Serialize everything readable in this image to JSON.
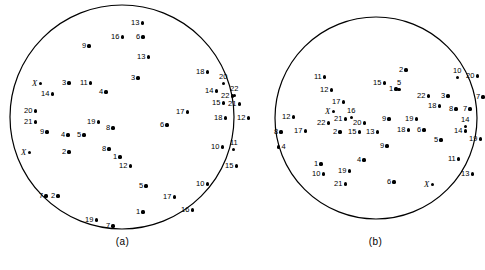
{
  "figure": {
    "type": "two-panel-circular-scatter",
    "panels": [
      {
        "id": "a",
        "caption": "(a)"
      },
      {
        "id": "b",
        "caption": "(b)"
      }
    ],
    "marker_color": "#000000",
    "outline_color": "#000000",
    "background_color": "#ffffff"
  },
  "chart_data": {
    "type": "scatter",
    "title": "",
    "xlabel": "",
    "ylabel": "",
    "grid": false,
    "legend": "none",
    "note": "Two circular fields, each containing labelled point markers. Labels are integers 1-22 plus italic X markers. Coordinates are in panel-local pixels.",
    "panels": [
      {
        "id": "a",
        "caption": "(a)",
        "circle": {
          "cx": 122,
          "cy": 117,
          "r": 112
        },
        "points": [
          {
            "label": "13",
            "x": 131,
            "y": 19,
            "side": "right"
          },
          {
            "label": "16",
            "x": 111,
            "y": 33,
            "side": "right"
          },
          {
            "label": "6",
            "x": 136,
            "y": 33,
            "side": "right"
          },
          {
            "label": "9",
            "x": 82,
            "y": 42,
            "side": "right"
          },
          {
            "label": "13",
            "x": 137,
            "y": 53,
            "side": "right"
          },
          {
            "label": "3",
            "x": 131,
            "y": 74,
            "side": "right"
          },
          {
            "label": "18",
            "x": 196,
            "y": 68,
            "side": "right"
          },
          {
            "label": "20",
            "x": 219,
            "y": 73,
            "side": "below"
          },
          {
            "label": "X",
            "x": 32,
            "y": 79,
            "side": "right"
          },
          {
            "label": "3",
            "x": 62,
            "y": 79,
            "side": "right"
          },
          {
            "label": "11",
            "x": 80,
            "y": 79,
            "side": "right"
          },
          {
            "label": "14",
            "x": 41,
            "y": 90,
            "side": "right"
          },
          {
            "label": "4",
            "x": 99,
            "y": 88,
            "side": "right"
          },
          {
            "label": "14",
            "x": 205,
            "y": 87,
            "side": "right"
          },
          {
            "label": "22",
            "x": 230,
            "y": 85,
            "side": "below"
          },
          {
            "label": "22",
            "x": 221,
            "y": 92,
            "side": "right"
          },
          {
            "label": "15",
            "x": 212,
            "y": 99,
            "side": "right"
          },
          {
            "label": "21",
            "x": 228,
            "y": 100,
            "side": "left"
          },
          {
            "label": "20",
            "x": 24,
            "y": 107,
            "side": "right"
          },
          {
            "label": "21",
            "x": 24,
            "y": 118,
            "side": "right"
          },
          {
            "label": "17",
            "x": 176,
            "y": 108,
            "side": "right"
          },
          {
            "label": "18",
            "x": 214,
            "y": 114,
            "side": "right"
          },
          {
            "label": "12",
            "x": 237,
            "y": 114,
            "side": "right"
          },
          {
            "label": "19",
            "x": 87,
            "y": 118,
            "side": "right"
          },
          {
            "label": "6",
            "x": 160,
            "y": 121,
            "side": "right"
          },
          {
            "label": "9",
            "x": 40,
            "y": 128,
            "side": "right"
          },
          {
            "label": "8",
            "x": 106,
            "y": 124,
            "side": "right"
          },
          {
            "label": "4",
            "x": 61,
            "y": 131,
            "side": "right"
          },
          {
            "label": "5",
            "x": 77,
            "y": 131,
            "side": "right"
          },
          {
            "label": "X",
            "x": 21,
            "y": 148,
            "side": "right"
          },
          {
            "label": "2",
            "x": 62,
            "y": 148,
            "side": "right"
          },
          {
            "label": "8",
            "x": 102,
            "y": 145,
            "side": "right"
          },
          {
            "label": "1",
            "x": 113,
            "y": 153,
            "side": "right"
          },
          {
            "label": "12",
            "x": 119,
            "y": 162,
            "side": "right"
          },
          {
            "label": "10",
            "x": 211,
            "y": 143,
            "side": "right"
          },
          {
            "label": "11",
            "x": 230,
            "y": 139,
            "side": "below"
          },
          {
            "label": "15",
            "x": 225,
            "y": 162,
            "side": "right"
          },
          {
            "label": "10",
            "x": 196,
            "y": 180,
            "side": "right"
          },
          {
            "label": "5",
            "x": 139,
            "y": 182,
            "side": "right"
          },
          {
            "label": "17",
            "x": 163,
            "y": 193,
            "side": "right"
          },
          {
            "label": "7",
            "x": 39,
            "y": 192,
            "side": "right"
          },
          {
            "label": "2",
            "x": 51,
            "y": 192,
            "side": "right"
          },
          {
            "label": "1",
            "x": 136,
            "y": 208,
            "side": "right"
          },
          {
            "label": "16",
            "x": 181,
            "y": 206,
            "side": "right"
          },
          {
            "label": "19",
            "x": 85,
            "y": 216,
            "side": "right"
          },
          {
            "label": "7",
            "x": 106,
            "y": 222,
            "side": "right"
          }
        ]
      },
      {
        "id": "b",
        "caption": "(b)",
        "circle": {
          "cx": 104,
          "cy": 118,
          "r": 101
        },
        "points": [
          {
            "label": "2",
            "x": 127,
            "y": 66,
            "side": "right"
          },
          {
            "label": "10",
            "x": 181,
            "y": 67,
            "side": "below"
          },
          {
            "label": "20",
            "x": 194,
            "y": 72,
            "side": "right"
          },
          {
            "label": "11",
            "x": 42,
            "y": 73,
            "side": "right"
          },
          {
            "label": "15",
            "x": 101,
            "y": 79,
            "side": "right"
          },
          {
            "label": "5",
            "x": 125,
            "y": 79,
            "side": "below"
          },
          {
            "label": "1",
            "x": 117,
            "y": 85,
            "side": "right"
          },
          {
            "label": "12",
            "x": 48,
            "y": 86,
            "side": "right"
          },
          {
            "label": "22",
            "x": 145,
            "y": 92,
            "side": "right"
          },
          {
            "label": "3",
            "x": 169,
            "y": 92,
            "side": "right"
          },
          {
            "label": "7",
            "x": 204,
            "y": 93,
            "side": "right"
          },
          {
            "label": "17",
            "x": 60,
            "y": 98,
            "side": "right"
          },
          {
            "label": "18",
            "x": 156,
            "y": 102,
            "side": "right"
          },
          {
            "label": "8",
            "x": 177,
            "y": 105,
            "side": "right"
          },
          {
            "label": "7",
            "x": 191,
            "y": 105,
            "side": "right"
          },
          {
            "label": "X",
            "x": 53,
            "y": 107,
            "side": "right"
          },
          {
            "label": "16",
            "x": 75,
            "y": 107,
            "side": "below"
          },
          {
            "label": "21",
            "x": 62,
            "y": 115,
            "side": "right"
          },
          {
            "label": "9",
            "x": 110,
            "y": 115,
            "side": "right"
          },
          {
            "label": "19",
            "x": 133,
            "y": 115,
            "side": "right"
          },
          {
            "label": "12",
            "x": 10,
            "y": 113,
            "side": "right"
          },
          {
            "label": "22",
            "x": 45,
            "y": 119,
            "side": "right"
          },
          {
            "label": "20",
            "x": 81,
            "y": 119,
            "side": "right"
          },
          {
            "label": "14",
            "x": 189,
            "y": 116,
            "side": "below"
          },
          {
            "label": "8",
            "x": 2,
            "y": 128,
            "side": "right"
          },
          {
            "label": "17",
            "x": 22,
            "y": 127,
            "side": "right"
          },
          {
            "label": "2",
            "x": 61,
            "y": 128,
            "side": "right"
          },
          {
            "label": "15",
            "x": 76,
            "y": 128,
            "side": "right"
          },
          {
            "label": "13",
            "x": 94,
            "y": 128,
            "side": "right"
          },
          {
            "label": "18",
            "x": 125,
            "y": 126,
            "side": "right"
          },
          {
            "label": "6",
            "x": 145,
            "y": 126,
            "side": "right"
          },
          {
            "label": "14",
            "x": 182,
            "y": 127,
            "side": "right"
          },
          {
            "label": "5",
            "x": 162,
            "y": 136,
            "side": "right"
          },
          {
            "label": "19",
            "x": 197,
            "y": 135,
            "side": "right"
          },
          {
            "label": "4",
            "x": 5,
            "y": 143,
            "side": "dotfirst"
          },
          {
            "label": "9",
            "x": 108,
            "y": 142,
            "side": "right"
          },
          {
            "label": "11",
            "x": 176,
            "y": 155,
            "side": "right"
          },
          {
            "label": "1",
            "x": 42,
            "y": 160,
            "side": "right"
          },
          {
            "label": "4",
            "x": 85,
            "y": 156,
            "side": "right"
          },
          {
            "label": "10",
            "x": 40,
            "y": 170,
            "side": "right"
          },
          {
            "label": "19",
            "x": 66,
            "y": 167,
            "side": "right"
          },
          {
            "label": "13",
            "x": 189,
            "y": 170,
            "side": "right"
          },
          {
            "label": "21",
            "x": 62,
            "y": 180,
            "side": "right"
          },
          {
            "label": "6",
            "x": 115,
            "y": 178,
            "side": "right"
          },
          {
            "label": "X",
            "x": 152,
            "y": 180,
            "side": "right"
          }
        ]
      }
    ]
  }
}
